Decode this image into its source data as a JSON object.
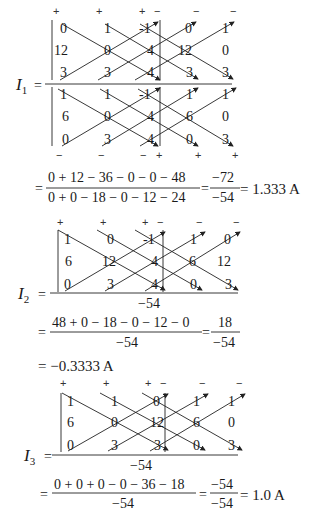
{
  "blocks": [
    {
      "label": "I",
      "sub": "1",
      "numerator_matrix": [
        [
          "0",
          "1",
          "-1",
          "0",
          "1"
        ],
        [
          "12",
          "0",
          "4",
          "12",
          "0"
        ],
        [
          "3",
          "3",
          "4",
          "3",
          "3"
        ]
      ],
      "denominator_matrix": [
        [
          "1",
          "1",
          "-1",
          "1",
          "1"
        ],
        [
          "6",
          "0",
          "4",
          "6",
          "0"
        ],
        [
          "0",
          "3",
          "4",
          "0",
          "3"
        ]
      ],
      "top_signs": [
        "+",
        "+",
        "+",
        "−",
        "−",
        "−"
      ],
      "bottom_signs": [
        "−",
        "−",
        "−",
        "+",
        "+",
        "+"
      ],
      "numerator_expr": "0 + 12 −  36 −  0 −  0 −  48",
      "denominator_expr": "0 + 0 −  18 −  0 −  12 −  24",
      "ratio_num": "−72",
      "ratio_den": "−54",
      "result": "= 1.333 A"
    },
    {
      "label": "I",
      "sub": "2",
      "numerator_matrix": [
        [
          "1",
          "0",
          "-1",
          "1",
          "0"
        ],
        [
          "6",
          "12",
          "4",
          "6",
          "12"
        ],
        [
          "0",
          "3",
          "4",
          "0",
          "3"
        ]
      ],
      "top_signs": [
        "+",
        "+",
        "+",
        "−",
        "−",
        "−"
      ],
      "denominator": "−54",
      "numerator_expr": "48 + 0 −  18 −  0 − 12 −  0",
      "denominator_expr": "−54",
      "ratio_num": "18",
      "ratio_den": "−54",
      "result": "= −0.3333 A"
    },
    {
      "label": "I",
      "sub": "3",
      "numerator_matrix": [
        [
          "1",
          "1",
          "0",
          "1",
          "1"
        ],
        [
          "6",
          "0",
          "12",
          "6",
          "0"
        ],
        [
          "0",
          "3",
          "3",
          "0",
          "3"
        ]
      ],
      "top_signs": [
        "+",
        "+",
        "+",
        "−",
        "−",
        "−"
      ],
      "denominator": "−54",
      "numerator_expr": "0 + 0 + 0 −  0 −  36 − 18",
      "denominator_expr": "−54",
      "ratio_num": "−54",
      "ratio_den": "−54",
      "result": "= 1.0 A"
    }
  ],
  "eq_sign": "="
}
